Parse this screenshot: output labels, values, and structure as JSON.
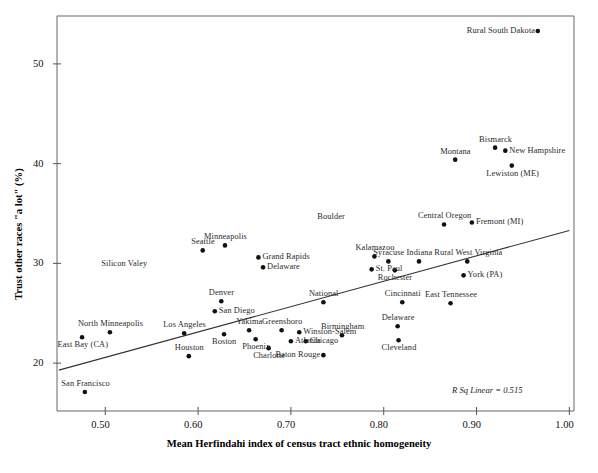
{
  "chart_data": {
    "type": "scatter",
    "title": "",
    "xlabel": "Mean Herfindahi index of census tract ethnic homogeneity",
    "ylabel": "Trust other races \"a lot\" (%)",
    "xlim": [
      0.448,
      1.005
    ],
    "ylim": [
      15.2,
      54.8
    ],
    "xticks": [
      "0.50",
      "0.60",
      "0.70",
      "0.80",
      "0.90",
      "1.00"
    ],
    "xtick_values": [
      0.5,
      0.6,
      0.7,
      0.8,
      0.9,
      1.0
    ],
    "yticks": [
      "20",
      "30",
      "40",
      "50"
    ],
    "ytick_values": [
      20,
      30,
      40,
      50
    ],
    "grid": false,
    "legend": "none",
    "annotation": "R Sq Linear = 0.515",
    "fit_line": {
      "type": "linear",
      "x_start": 0.45,
      "y_start": 19.3,
      "x_end": 1.0,
      "y_end": 33.3
    },
    "points": [
      {
        "label": "San Francisco",
        "x": 0.478,
        "y": 17.1,
        "label_pos": "above"
      },
      {
        "label": "East Bay (CA)",
        "x": 0.475,
        "y": 22.6,
        "label_pos": "below"
      },
      {
        "label": "North Minneapolis",
        "x": 0.505,
        "y": 23.1,
        "label_pos": "above"
      },
      {
        "label": "Los Angeles",
        "x": 0.585,
        "y": 23.0,
        "label_pos": "above"
      },
      {
        "label": "Houston",
        "x": 0.59,
        "y": 20.7,
        "label_pos": "above"
      },
      {
        "label": "Silicon Valey",
        "x": 0.52,
        "y": 29.9,
        "label_pos": "none"
      },
      {
        "label": "Denver",
        "x": 0.625,
        "y": 26.2,
        "label_pos": "above"
      },
      {
        "label": "San Diego",
        "x": 0.618,
        "y": 25.2,
        "label_pos": "right"
      },
      {
        "label": "Boston",
        "x": 0.628,
        "y": 22.9,
        "label_pos": "below"
      },
      {
        "label": "Yakima",
        "x": 0.655,
        "y": 23.3,
        "label_pos": "above"
      },
      {
        "label": "Phoenix",
        "x": 0.662,
        "y": 22.4,
        "label_pos": "below"
      },
      {
        "label": "Charlotte",
        "x": 0.676,
        "y": 21.5,
        "label_pos": "below"
      },
      {
        "label": "Greensboro",
        "x": 0.69,
        "y": 23.3,
        "label_pos": "above"
      },
      {
        "label": "Atlanta",
        "x": 0.7,
        "y": 22.2,
        "label_pos": "right"
      },
      {
        "label": "Winston-Salem",
        "x": 0.709,
        "y": 23.1,
        "label_pos": "right"
      },
      {
        "label": "Chicago",
        "x": 0.716,
        "y": 22.2,
        "label_pos": "right"
      },
      {
        "label": "Baton Rouge",
        "x": 0.735,
        "y": 20.8,
        "label_pos": "left"
      },
      {
        "label": "Seattle",
        "x": 0.605,
        "y": 31.3,
        "label_pos": "above"
      },
      {
        "label": "Minneapolis",
        "x": 0.629,
        "y": 31.8,
        "label_pos": "above"
      },
      {
        "label": "Grand Rapids",
        "x": 0.665,
        "y": 30.6,
        "label_pos": "right"
      },
      {
        "label": "Delaware",
        "x": 0.67,
        "y": 29.6,
        "label_pos": "right"
      },
      {
        "label": "National",
        "x": 0.735,
        "y": 26.1,
        "label_pos": "above"
      },
      {
        "label": "Birmingham",
        "x": 0.755,
        "y": 22.8,
        "label_pos": "above"
      },
      {
        "label": "Boulder",
        "x": 0.743,
        "y": 34.6,
        "label_pos": "none"
      },
      {
        "label": "Kalamazoo",
        "x": 0.79,
        "y": 30.7,
        "label_pos": "above"
      },
      {
        "label": "St. Paul",
        "x": 0.787,
        "y": 29.4,
        "label_pos": "right"
      },
      {
        "label": "Syracuse",
        "x": 0.805,
        "y": 30.2,
        "label_pos": "above"
      },
      {
        "label": "Rochester",
        "x": 0.812,
        "y": 29.3,
        "label_pos": "below"
      },
      {
        "label": "Indiana",
        "x": 0.838,
        "y": 30.2,
        "label_pos": "above"
      },
      {
        "label": "Cincinnati",
        "x": 0.82,
        "y": 26.1,
        "label_pos": "above"
      },
      {
        "label": "Delaware",
        "x": 0.815,
        "y": 23.7,
        "label_pos": "above"
      },
      {
        "label": "Cleveland",
        "x": 0.816,
        "y": 22.3,
        "label_pos": "below"
      },
      {
        "label": "East Tennessee",
        "x": 0.872,
        "y": 26.0,
        "label_pos": "above"
      },
      {
        "label": "Central Oregon",
        "x": 0.865,
        "y": 33.9,
        "label_pos": "above"
      },
      {
        "label": "Fremont (MI)",
        "x": 0.895,
        "y": 34.1,
        "label_pos": "right"
      },
      {
        "label": "Rural West Virginia",
        "x": 0.89,
        "y": 30.2,
        "label_pos": "above"
      },
      {
        "label": "York (PA)",
        "x": 0.886,
        "y": 28.8,
        "label_pos": "right"
      },
      {
        "label": "Montana",
        "x": 0.877,
        "y": 40.4,
        "label_pos": "above"
      },
      {
        "label": "Bismarck",
        "x": 0.92,
        "y": 41.6,
        "label_pos": "above"
      },
      {
        "label": "New Hampshire",
        "x": 0.931,
        "y": 41.3,
        "label_pos": "right"
      },
      {
        "label": "Lewiston (ME)",
        "x": 0.938,
        "y": 39.8,
        "label_pos": "below"
      },
      {
        "label": "Rural South Dakota",
        "x": 0.966,
        "y": 53.3,
        "label_pos": "left"
      }
    ]
  },
  "colors": {
    "marker": "#111111",
    "axis": "#555555",
    "fit_line": "#333333",
    "text": "#1a1a1a"
  }
}
